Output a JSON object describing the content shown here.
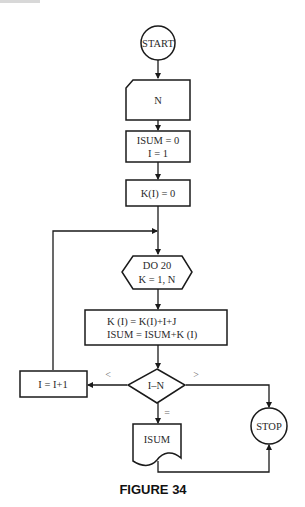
{
  "figure": {
    "caption": "FIGURE 34",
    "colors": {
      "stroke": "#1a1a1a",
      "text": "#2a2a2a",
      "background": "#ffffff"
    }
  },
  "nodes": {
    "start": {
      "type": "terminal",
      "label": "START"
    },
    "input_n": {
      "type": "input-card",
      "label": "N"
    },
    "init": {
      "type": "process",
      "lines": [
        "ISUM = 0",
        "I = 1"
      ]
    },
    "init_k": {
      "type": "process",
      "label": "K(I) = 0"
    },
    "do_loop": {
      "type": "preparation",
      "lines": [
        "DO 20",
        "K = 1, N"
      ]
    },
    "compute": {
      "type": "process",
      "lines": [
        "K (I) = K(I)+I+J",
        "ISUM = ISUM+K (I)"
      ]
    },
    "decision": {
      "type": "decision",
      "label": "I–N"
    },
    "increment": {
      "type": "process",
      "label": "I = I+1"
    },
    "output": {
      "type": "document",
      "label": "ISUM"
    },
    "stop": {
      "type": "terminal",
      "label": "STOP"
    }
  },
  "branches": {
    "less": "<",
    "greater": ">",
    "equal": "="
  }
}
